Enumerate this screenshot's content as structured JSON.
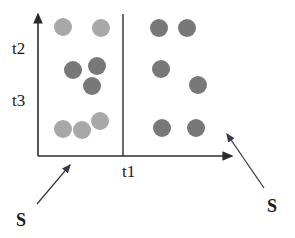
{
  "figure": {
    "title": "",
    "background_color": "#ffffff",
    "axis_color": "#2b2b2b",
    "divider_color": "#2b2b2b"
  },
  "axes": {
    "x_axis_label": "t1",
    "y_axis_labels": [
      "t2",
      "t3"
    ],
    "x_axis": {
      "x1": 38,
      "y1": 156,
      "x2": 232,
      "y2": 156,
      "arrow": "right"
    },
    "y_axis": {
      "x1": 38,
      "y1": 156,
      "x2": 38,
      "y2": 14,
      "arrow": "up"
    },
    "divider": {
      "x1": 123,
      "y1": 14,
      "x2": 123,
      "y2": 156
    }
  },
  "annotations": [
    {
      "label": "S",
      "name": "annotation-s-left",
      "label_x": 16,
      "label_y": 211,
      "arrow": {
        "x1": 37,
        "y1": 204,
        "x2": 70,
        "y2": 165
      }
    },
    {
      "label": "S",
      "name": "annotation-s-right",
      "label_x": 267,
      "label_y": 197,
      "arrow": {
        "x1": 264,
        "y1": 188,
        "x2": 227,
        "y2": 134
      }
    }
  ],
  "chart_data": {
    "type": "scatter",
    "title": "",
    "xlabel": "t1",
    "ylabel": "",
    "ytick_labels": [
      "t2",
      "t3"
    ],
    "grid": false,
    "legend": null,
    "xlim": [
      38,
      232
    ],
    "ylim": [
      14,
      156
    ],
    "colors": {
      "light_gray": "#a8a8a8",
      "dark_gray": "#787878"
    },
    "series": [
      {
        "name": "light-gray-points",
        "color": "#a8a8a8",
        "marker": "circle",
        "radius": 9,
        "points": [
          {
            "x": 63,
            "y": 27,
            "group": "left"
          },
          {
            "x": 101,
            "y": 28,
            "group": "left"
          },
          {
            "x": 100,
            "y": 121,
            "group": "left"
          },
          {
            "x": 63,
            "y": 129,
            "group": "left"
          },
          {
            "x": 82,
            "y": 130,
            "group": "left"
          }
        ]
      },
      {
        "name": "dark-gray-points",
        "color": "#787878",
        "marker": "circle",
        "radius": 9,
        "points": [
          {
            "x": 73,
            "y": 70,
            "group": "left"
          },
          {
            "x": 97,
            "y": 66,
            "group": "left"
          },
          {
            "x": 92,
            "y": 86,
            "group": "left"
          },
          {
            "x": 159,
            "y": 28,
            "group": "right"
          },
          {
            "x": 187,
            "y": 28,
            "group": "right"
          },
          {
            "x": 161,
            "y": 69,
            "group": "right"
          },
          {
            "x": 198,
            "y": 85,
            "group": "right"
          },
          {
            "x": 162,
            "y": 128,
            "group": "right"
          },
          {
            "x": 196,
            "y": 128,
            "group": "right"
          }
        ]
      }
    ]
  }
}
